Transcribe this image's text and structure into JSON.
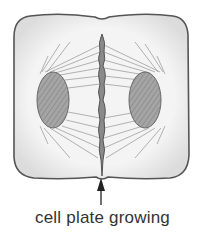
{
  "diagram": {
    "labels": {
      "cell_plate": "cell plate growing"
    },
    "parts": [
      "cell wall",
      "left daughter nucleus",
      "right daughter nucleus",
      "spindle fibers",
      "cell plate"
    ],
    "colors": {
      "cell_fill": "#f2f2f2",
      "cell_outline": "#555555",
      "nucleus_fill": "#9a9a9a",
      "fibers": "#8a8a8a",
      "plate": "#6a6a6a",
      "text": "#333333"
    }
  }
}
